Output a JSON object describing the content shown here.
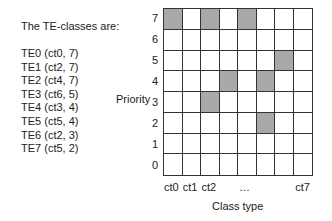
{
  "title": "The TE-classes are:",
  "te_classes": [
    "TE0 (ct0, 7)",
    "TE1 (ct2, 7)",
    "TE2 (ct4, 7)",
    "TE3 (ct6, 5)",
    "TE4 (ct3, 4)",
    "TE5 (ct5, 4)",
    "TE6 (ct2, 3)",
    "TE7 (ct5, 2)"
  ],
  "y_axis_label": "Priority",
  "x_axis_label": "Class type",
  "y_ticks": [
    "7",
    "6",
    "5",
    "4",
    "3",
    "2",
    "1",
    "0"
  ],
  "x_ticks": [
    {
      "label": "ct0",
      "col": 0
    },
    {
      "label": "ct1",
      "col": 1
    },
    {
      "label": "ct2",
      "col": 2
    },
    {
      "label": "…",
      "col": 4
    },
    {
      "label": "ct7",
      "col": 7
    }
  ],
  "filled_cells": [
    {
      "ct": 0,
      "priority": 7
    },
    {
      "ct": 2,
      "priority": 7
    },
    {
      "ct": 4,
      "priority": 7
    },
    {
      "ct": 6,
      "priority": 5
    },
    {
      "ct": 3,
      "priority": 4
    },
    {
      "ct": 5,
      "priority": 4
    },
    {
      "ct": 2,
      "priority": 3
    },
    {
      "ct": 5,
      "priority": 2
    }
  ],
  "colors": {
    "filled": "#a9a9a9",
    "grid_line": "#333333"
  }
}
